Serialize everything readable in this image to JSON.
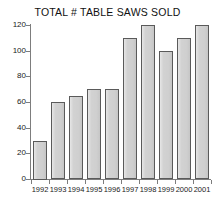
{
  "chart_data": {
    "type": "bar",
    "title": "TOTAL # TABLE SAWS SOLD",
    "xlabel": "",
    "ylabel": "",
    "categories": [
      "1992",
      "1993",
      "1994",
      "1995",
      "1996",
      "1997",
      "1998",
      "1999",
      "2000",
      "2001"
    ],
    "values": [
      30,
      60,
      65,
      70,
      70,
      110,
      120,
      100,
      110,
      120
    ],
    "ylim": [
      0,
      120
    ],
    "ytick_values": [
      0,
      20,
      40,
      60,
      80,
      100,
      120
    ],
    "ytick_labels": [
      "0",
      "20",
      "40",
      "60",
      "80",
      "100",
      "120"
    ],
    "grid": false,
    "legend": false,
    "colors": {
      "bar_fill": "#d4d4d4",
      "bar_edge": "#5a5a5a",
      "axis": "#7d7d7d",
      "text": "#1a1a1a",
      "background": "#ffffff"
    }
  }
}
